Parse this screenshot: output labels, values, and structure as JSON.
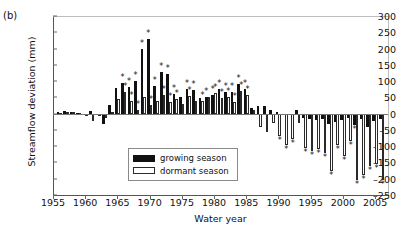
{
  "panel": {
    "label": "(b)"
  },
  "legend": {
    "items": [
      {
        "key": "growing",
        "label": "growing season",
        "color": "#111111",
        "style": "filled"
      },
      {
        "key": "dormant",
        "label": "dormant season",
        "color": "#ffffff",
        "style": "outline"
      }
    ]
  },
  "chart_data": {
    "type": "bar",
    "title": "",
    "subtitle": "",
    "xlabel": "Water year",
    "ylabel": "Streamflow deviation (mm)",
    "xlim": [
      1955,
      2007
    ],
    "ylim": [
      -250,
      300
    ],
    "yticks": [
      300,
      250,
      200,
      150,
      100,
      50,
      0,
      -50,
      -100,
      -150,
      -200,
      -250
    ],
    "xticks": [
      1955,
      1960,
      1965,
      1970,
      1975,
      1980,
      1985,
      1990,
      1995,
      2000,
      2005
    ],
    "grid": false,
    "legend_position": "center-left",
    "significance_marker": "*",
    "x": [
      1956,
      1957,
      1958,
      1959,
      1960,
      1961,
      1962,
      1963,
      1964,
      1965,
      1966,
      1967,
      1968,
      1969,
      1970,
      1971,
      1972,
      1973,
      1974,
      1975,
      1976,
      1977,
      1978,
      1979,
      1980,
      1981,
      1982,
      1983,
      1984,
      1985,
      1986,
      1987,
      1988,
      1989,
      1990,
      1991,
      1992,
      1993,
      1994,
      1995,
      1996,
      1997,
      1998,
      1999,
      2000,
      2001,
      2002,
      2003,
      2004,
      2005,
      2006
    ],
    "series": [
      {
        "name": "growing season",
        "color": "#111111",
        "values": [
          4,
          7,
          6,
          2,
          -3,
          8,
          -4,
          -32,
          28,
          78,
          95,
          82,
          100,
          198,
          228,
          84,
          128,
          122,
          60,
          52,
          76,
          72,
          47,
          50,
          58,
          76,
          68,
          68,
          90,
          75,
          18,
          22,
          25,
          10,
          5,
          -2,
          -3,
          12,
          -13,
          -18,
          -20,
          -16,
          -33,
          -25,
          -20,
          -12,
          -35,
          -18,
          -40,
          -22,
          -15
        ],
        "significant": [
          1966,
          1967,
          1968,
          1969,
          1970,
          1971,
          1972,
          1973,
          1974,
          1976,
          1977,
          1979,
          1980,
          1981,
          1982,
          1983,
          1984,
          1985,
          2002
        ]
      },
      {
        "name": "dormant season",
        "color": "#ffffff",
        "values": [
          3,
          5,
          4,
          1,
          -7,
          -22,
          -6,
          -12,
          6,
          44,
          65,
          38,
          12,
          52,
          28,
          40,
          58,
          36,
          44,
          30,
          54,
          40,
          38,
          50,
          62,
          48,
          52,
          36,
          70,
          58,
          10,
          -40,
          -55,
          -30,
          -70,
          -95,
          -78,
          -30,
          -105,
          -115,
          -110,
          -120,
          -175,
          -95,
          -130,
          -85,
          -205,
          -190,
          -160,
          -155,
          -205
        ],
        "significant": [
          1966,
          1967,
          1968,
          1970,
          1972,
          1973,
          1974,
          1976,
          1978,
          1980,
          1981,
          1982,
          1983,
          1984,
          1985,
          1990,
          1991,
          1992,
          1994,
          1995,
          1996,
          1997,
          1998,
          1999,
          2000,
          2001,
          2002,
          2003,
          2004,
          2005,
          2006
        ]
      }
    ]
  }
}
